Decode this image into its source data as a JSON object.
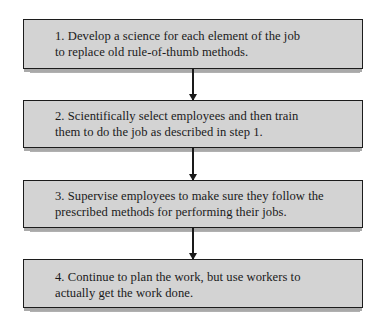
{
  "diagram": {
    "type": "vertical-flowchart",
    "steps": [
      {
        "number": "1.",
        "lines": [
          "1.  Develop a science for each element of the job",
          "to replace old rule-of-thumb methods."
        ]
      },
      {
        "number": "2.",
        "lines": [
          "2.  Scientifically select employees and then train",
          "them to do the job as described in step 1."
        ]
      },
      {
        "number": "3.",
        "lines": [
          "3.  Supervise employees to make sure they follow the",
          "prescribed methods for performing their jobs."
        ]
      },
      {
        "number": "4.",
        "lines": [
          "4.  Continue to plan the work, but use workers to",
          "actually get the work done."
        ]
      }
    ],
    "connectors": [
      {
        "from": 1,
        "to": 2,
        "direction": "down"
      },
      {
        "from": 2,
        "to": 3,
        "direction": "down"
      },
      {
        "from": 3,
        "to": 4,
        "direction": "down"
      }
    ],
    "colors": {
      "box_fill": "#d3d3d3",
      "box_border": "#1c1c1c",
      "shadow": "#b0b0b0",
      "arrow": "#1a1a1a",
      "text": "#1a1a1a",
      "background": "#ffffff"
    }
  }
}
